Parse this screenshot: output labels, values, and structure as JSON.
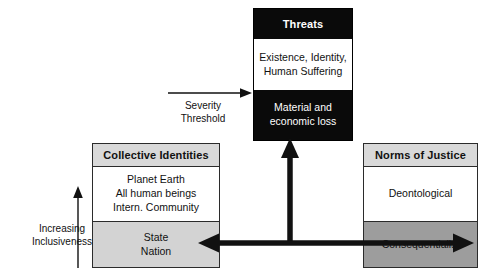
{
  "diagram": {
    "title_threats": "Threats",
    "title_identities": "Collective Identities",
    "title_norms": "Norms of Justice",
    "threats": {
      "header": "Threats",
      "upper_cell": "Existence, Identity,\nHuman Suffering",
      "lower_cell": "Material and\neconomic loss"
    },
    "identities": {
      "header": "Collective Identities",
      "upper_cell": "Planet Earth\nAll human beings\nIntern. Community",
      "lower_cell": "State\nNation"
    },
    "norms": {
      "header": "Norms of Justice",
      "upper_cell": "Deontological",
      "lower_cell": "Consequentialist"
    },
    "annotations": {
      "severity_threshold": "Severity\nThreshold",
      "increasing_inclusiveness": "Increasing\nInclusiveness"
    },
    "arrows": {
      "severity_threshold_arrow": "thin-right-arrow",
      "inclusiveness_arrow": "thin-up-arrow",
      "threats_link_arrow": "thick-up-arrow",
      "identities_norms_link_arrow": "thick-double-horizontal-arrow"
    },
    "colors": {
      "threats_fill": "#0a0a0a",
      "threats_text": "#ffffff",
      "header_fill": "#d9d9d9",
      "identities_lower_fill": "#d3d3d3",
      "norms_lower_fill": "#9d9d9d",
      "white_fill": "#ffffff",
      "border": "#2b2b2b",
      "text": "#111111"
    }
  }
}
